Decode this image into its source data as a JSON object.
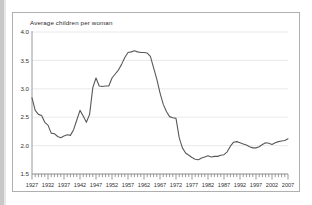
{
  "figure": {
    "title": "Average children per woman"
  },
  "chart_data": {
    "type": "line",
    "title": "Average children per woman",
    "xlabel": "",
    "ylabel": "Average children per woman",
    "ylim": [
      1.5,
      4.0
    ],
    "xlim": [
      1927,
      2007
    ],
    "yticks": [
      "1.5",
      "2.0",
      "2.5",
      "3.0",
      "3.5",
      "4.0"
    ],
    "ytick_values": [
      1.5,
      2.0,
      2.5,
      3.0,
      3.5,
      4.0
    ],
    "xticks": [
      "1927",
      "1932",
      "1937",
      "1942",
      "1947",
      "1952",
      "1957",
      "1962",
      "1967",
      "1972",
      "1977",
      "1982",
      "1987",
      "1992",
      "1997",
      "2002",
      "2007"
    ],
    "xtick_values": [
      1927,
      1932,
      1937,
      1942,
      1947,
      1952,
      1957,
      1962,
      1967,
      1972,
      1977,
      1982,
      1987,
      1992,
      1997,
      2002,
      2007
    ],
    "minor_tick_interval": 1,
    "grid": "horizontal",
    "legend": "none",
    "line_color": "#595959",
    "grid_color": "#e3e3e3",
    "axis_color": "#9a9a9a",
    "series": [
      {
        "name": "Average children per woman",
        "x": [
          1927,
          1928,
          1929,
          1930,
          1931,
          1932,
          1933,
          1934,
          1935,
          1936,
          1937,
          1938,
          1939,
          1940,
          1941,
          1942,
          1943,
          1944,
          1945,
          1946,
          1947,
          1948,
          1949,
          1950,
          1951,
          1952,
          1953,
          1954,
          1955,
          1956,
          1957,
          1958,
          1959,
          1960,
          1961,
          1962,
          1963,
          1964,
          1965,
          1966,
          1967,
          1968,
          1969,
          1970,
          1971,
          1972,
          1973,
          1974,
          1975,
          1976,
          1977,
          1978,
          1979,
          1980,
          1981,
          1982,
          1983,
          1984,
          1985,
          1986,
          1987,
          1988,
          1989,
          1990,
          1991,
          1992,
          1993,
          1994,
          1995,
          1996,
          1997,
          1998,
          1999,
          2000,
          2001,
          2002,
          2003,
          2004,
          2005,
          2006,
          2007
        ],
        "values": [
          2.84,
          2.62,
          2.55,
          2.53,
          2.41,
          2.36,
          2.22,
          2.21,
          2.16,
          2.14,
          2.17,
          2.19,
          2.18,
          2.28,
          2.45,
          2.62,
          2.52,
          2.41,
          2.55,
          3.02,
          3.19,
          3.05,
          3.04,
          3.05,
          3.05,
          3.19,
          3.26,
          3.33,
          3.43,
          3.55,
          3.64,
          3.65,
          3.67,
          3.65,
          3.64,
          3.64,
          3.63,
          3.57,
          3.37,
          3.17,
          2.93,
          2.73,
          2.6,
          2.51,
          2.49,
          2.48,
          2.14,
          1.96,
          1.87,
          1.83,
          1.79,
          1.76,
          1.75,
          1.78,
          1.8,
          1.82,
          1.8,
          1.81,
          1.81,
          1.83,
          1.84,
          1.89,
          1.99,
          2.06,
          2.07,
          2.05,
          2.03,
          2.01,
          1.98,
          1.96,
          1.96,
          1.98,
          2.02,
          2.05,
          2.04,
          2.02,
          2.05,
          2.07,
          2.08,
          2.09,
          2.12
        ]
      }
    ]
  }
}
